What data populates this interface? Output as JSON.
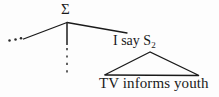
{
  "figure": {
    "type": "syntax-tree-diagram",
    "background_color": "#fdfdfd",
    "ink_color": "#1a1a1a",
    "root": {
      "label": "Σ",
      "name": "sigma-root-node"
    },
    "branches": {
      "left_ellipsis": "…",
      "middle_dotted": true,
      "right_label_text": "I say S",
      "right_label_subscript": "2"
    },
    "constituent": {
      "label_main": "I say S",
      "label_subscript": "2",
      "triangle": true,
      "terminal_string": "TV informs youth"
    }
  },
  "geometry": {
    "apex": {
      "x": 67,
      "y": 22
    },
    "left_branch_end": {
      "x": 23,
      "y": 39
    },
    "right_branch_end": {
      "x": 127,
      "y": 33
    },
    "dotted_line": {
      "x": 67,
      "y_start": 30,
      "y_end": 72
    },
    "triangle": {
      "apex": {
        "x": 150,
        "y": 52
      },
      "left": {
        "x": 104,
        "y": 75
      },
      "right": {
        "x": 199,
        "y": 75
      }
    },
    "ellipsis_dots": [
      {
        "x": 9,
        "y": 40
      },
      {
        "x": 15,
        "y": 39
      },
      {
        "x": 21,
        "y": 38
      }
    ]
  }
}
